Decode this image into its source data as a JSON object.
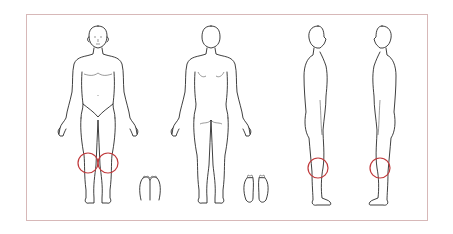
{
  "diagram": {
    "type": "body-chart",
    "frame_color": "#d7b8b8",
    "marker_color": "#c0393b",
    "views": [
      {
        "name": "front",
        "label": ""
      },
      {
        "name": "back",
        "label": ""
      },
      {
        "name": "right-side",
        "label": ""
      },
      {
        "name": "left-side",
        "label": ""
      },
      {
        "name": "feet-top",
        "label": ""
      },
      {
        "name": "feet-soles",
        "label": ""
      }
    ],
    "markers": [
      {
        "view": "front",
        "region": "right-knee",
        "cx": 88,
        "cy": 163,
        "r": 10
      },
      {
        "view": "front",
        "region": "left-knee",
        "cx": 108,
        "cy": 163,
        "r": 10
      },
      {
        "view": "right-side",
        "region": "knee",
        "cx": 318,
        "cy": 168,
        "r": 10
      },
      {
        "view": "left-side",
        "region": "knee",
        "cx": 380,
        "cy": 168,
        "r": 10
      }
    ]
  }
}
